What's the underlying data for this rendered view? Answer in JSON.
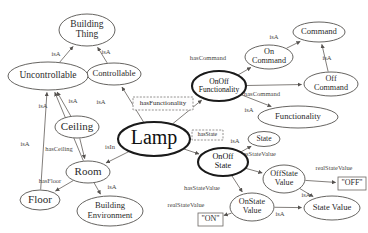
{
  "diagram": {
    "type": "ontology-graph",
    "colors": {
      "node_stroke": "#55524f",
      "emphasis_stroke": "#1a1a1a",
      "edge_stroke": "#6b6763",
      "text": "#2b2b2b",
      "background": "#ffffff"
    },
    "nodes": [
      {
        "id": "building-thing",
        "label": "Building Thing",
        "lines": [
          "Building",
          "Thing"
        ],
        "cx": 87,
        "cy": 30,
        "rx": 28,
        "ry": 16,
        "font": 9.5,
        "emph": false
      },
      {
        "id": "controllable",
        "label": "Controllable",
        "lines": [
          "Controllable"
        ],
        "cx": 114,
        "cy": 74,
        "rx": 27,
        "ry": 11,
        "font": 8.6,
        "emph": false
      },
      {
        "id": "uncontrollable",
        "label": "Uncontrollable",
        "lines": [
          "Uncontrollable"
        ],
        "cx": 48,
        "cy": 76,
        "rx": 40,
        "ry": 14,
        "font": 9.5,
        "emph": false
      },
      {
        "id": "ceiling",
        "label": "Ceiling",
        "lines": [
          "Ceiling"
        ],
        "cx": 77,
        "cy": 127,
        "rx": 22,
        "ry": 11,
        "font": 11,
        "emph": false
      },
      {
        "id": "room",
        "label": "Room",
        "lines": [
          "Room"
        ],
        "cx": 88,
        "cy": 172,
        "rx": 22,
        "ry": 11,
        "font": 11,
        "emph": false
      },
      {
        "id": "floor",
        "label": "Floor",
        "lines": [
          "Floor"
        ],
        "cx": 40,
        "cy": 200,
        "rx": 20,
        "ry": 10,
        "font": 11,
        "emph": false
      },
      {
        "id": "building-environment",
        "label": "Building Environment",
        "lines": [
          "Building",
          "Environment"
        ],
        "cx": 110,
        "cy": 211,
        "rx": 33,
        "ry": 15,
        "font": 8.6,
        "emph": false
      },
      {
        "id": "lamp",
        "label": "Lamp",
        "lines": [
          "Lamp"
        ],
        "cx": 154,
        "cy": 139,
        "rx": 36,
        "ry": 17,
        "font": 20,
        "emph": true
      },
      {
        "id": "onoff-functionality",
        "label": "OnOff Functionality",
        "lines": [
          "OnOff",
          "Functionality"
        ],
        "cx": 219,
        "cy": 86,
        "rx": 27,
        "ry": 15,
        "font": 7.6,
        "emph": true
      },
      {
        "id": "functionality",
        "label": "Functionality",
        "lines": [
          "Functionality"
        ],
        "cx": 298,
        "cy": 117,
        "rx": 40,
        "ry": 11,
        "font": 8.6,
        "emph": false
      },
      {
        "id": "on-command",
        "label": "On Command",
        "lines": [
          "On",
          "Command"
        ],
        "cx": 269,
        "cy": 57,
        "rx": 24,
        "ry": 12,
        "font": 8.2,
        "emph": false
      },
      {
        "id": "command",
        "label": "Command",
        "lines": [
          "Command"
        ],
        "cx": 319,
        "cy": 32,
        "rx": 26,
        "ry": 10,
        "font": 8.6,
        "emph": false
      },
      {
        "id": "off-command",
        "label": "Off Command",
        "lines": [
          "Off",
          "Command"
        ],
        "cx": 331,
        "cy": 84,
        "rx": 27,
        "ry": 12,
        "font": 8.2,
        "emph": false
      },
      {
        "id": "state",
        "label": "State",
        "lines": [
          "State"
        ],
        "cx": 264,
        "cy": 139,
        "rx": 16,
        "ry": 7.5,
        "font": 7.6,
        "emph": false
      },
      {
        "id": "onoff-state",
        "label": "OnOff State",
        "lines": [
          "OnOff",
          "State"
        ],
        "cx": 223,
        "cy": 162,
        "rx": 25,
        "ry": 14,
        "font": 8.2,
        "emph": true
      },
      {
        "id": "offstate-value",
        "label": "OffState Value",
        "lines": [
          "OffState",
          "Value"
        ],
        "cx": 284,
        "cy": 179,
        "rx": 21,
        "ry": 14,
        "font": 8.2,
        "emph": false
      },
      {
        "id": "onstate-value",
        "label": "OnState Value",
        "lines": [
          "OnState",
          "Value"
        ],
        "cx": 252,
        "cy": 207,
        "rx": 22,
        "ry": 14,
        "font": 8.2,
        "emph": false
      },
      {
        "id": "state-value",
        "label": "State Value",
        "lines": [
          "State Value"
        ],
        "cx": 332,
        "cy": 208,
        "rx": 28,
        "ry": 12,
        "font": 8.6,
        "emph": false
      }
    ],
    "property_boxes": [
      {
        "id": "has-functionality-box",
        "label": "hasFunctionality",
        "x": 133,
        "y": 97,
        "w": 60,
        "h": 13,
        "font": 7.0
      },
      {
        "id": "has-state-box",
        "label": "hasState",
        "x": 192,
        "y": 130,
        "w": 31,
        "h": 10,
        "font": 5.8
      }
    ],
    "literal_boxes": [
      {
        "id": "literal-off",
        "label": "\"OFF\"",
        "x": 338,
        "y": 177,
        "w": 28,
        "h": 13,
        "font": 8.0
      },
      {
        "id": "literal-on",
        "label": "\"ON\"",
        "x": 198,
        "y": 213,
        "w": 25,
        "h": 13,
        "font": 8.0
      }
    ],
    "edges": [
      {
        "id": "e-uncontrollable-buildingthing",
        "label": "isA",
        "from": "uncontrollable",
        "to": "building-thing",
        "lx": 56,
        "ly": 54,
        "font": 6.6
      },
      {
        "id": "e-controllable-buildingthing",
        "label": "isA",
        "from": "controllable",
        "to": "building-thing",
        "lx": 106,
        "ly": 52,
        "font": 6.6
      },
      {
        "id": "e-ceiling-uncontrollable",
        "label": "isA",
        "from": "ceiling",
        "to": "uncontrollable",
        "lx": 43,
        "ly": 106,
        "font": 6.6
      },
      {
        "id": "e-floor-uncontrollable",
        "label": "isA",
        "from": "floor",
        "to": "uncontrollable",
        "lx": 25,
        "ly": 144,
        "font": 6.6
      },
      {
        "id": "e-room-uncontrollable",
        "label": "isA",
        "from": "room",
        "to": "uncontrollable",
        "lx": 73,
        "ly": 101,
        "font": 6.6
      },
      {
        "id": "e-ceiling-room",
        "label": "hasCeiling",
        "from": "ceiling",
        "to": "room",
        "lx": 59,
        "ly": 150,
        "font": 6.4
      },
      {
        "id": "e-room-floor",
        "label": "hasFloor",
        "from": "room",
        "to": "floor",
        "lx": 50,
        "ly": 182,
        "font": 6.4
      },
      {
        "id": "e-room-buildingenv",
        "label": "isA",
        "from": "room",
        "to": "building-environment",
        "lx": 112,
        "ly": 187,
        "font": 6.6
      },
      {
        "id": "e-lamp-room",
        "label": "isIn",
        "from": "lamp",
        "to": "room",
        "lx": 110,
        "ly": 147,
        "font": 6.6
      },
      {
        "id": "e-lamp-controllable",
        "label": "isA",
        "from": "lamp",
        "to": "controllable",
        "lx": 101,
        "ly": 102,
        "font": 6.6
      },
      {
        "id": "e-lamp-onofffunctionality",
        "label": "hasFunctionality",
        "from": "lamp",
        "to": "onoff-functionality",
        "lx": 163,
        "ly": 103,
        "font": 7.0
      },
      {
        "id": "e-onofffunc-functionality",
        "label": "isA",
        "from": "onoff-functionality",
        "to": "functionality",
        "lx": 249,
        "ly": 110,
        "font": 6.6
      },
      {
        "id": "e-onofffunc-oncommand",
        "label": "hasCommand",
        "from": "onoff-functionality",
        "to": "on-command",
        "lx": 208,
        "ly": 58,
        "font": 6.6
      },
      {
        "id": "e-onofffunc-offcommand",
        "label": "hasCommand",
        "from": "onoff-functionality",
        "to": "off-command",
        "lx": 262,
        "ly": 94,
        "font": 6.6
      },
      {
        "id": "e-oncommand-command",
        "label": "isA",
        "from": "on-command",
        "to": "command",
        "lx": 274,
        "ly": 37,
        "font": 6.6
      },
      {
        "id": "e-offcommand-command",
        "label": "isA",
        "from": "off-command",
        "to": "command",
        "lx": 327,
        "ly": 58,
        "font": 6.6
      },
      {
        "id": "e-lamp-onoffstate",
        "label": "hasState",
        "from": "lamp",
        "to": "onoff-state",
        "lx": 207,
        "ly": 135,
        "font": 5.8
      },
      {
        "id": "e-onoffstate-state",
        "label": "isA",
        "from": "onoff-state",
        "to": "state",
        "lx": 235,
        "ly": 141,
        "font": 6.6
      },
      {
        "id": "e-onoffstate-offstatevalue",
        "label": "hasStateValue",
        "from": "onoff-state",
        "to": "offstate-value",
        "lx": 258,
        "ly": 155,
        "font": 6.4
      },
      {
        "id": "e-onoffstate-onstatevalue",
        "label": "hasStateValue",
        "from": "onoff-state",
        "to": "onstate-value",
        "lx": 202,
        "ly": 189,
        "font": 6.4
      },
      {
        "id": "e-offstatevalue-statevalue",
        "label": "isA",
        "from": "offstate-value",
        "to": "state-value",
        "lx": 306,
        "ly": 195,
        "font": 6.6
      },
      {
        "id": "e-onstatevalue-statevalue",
        "label": "isA",
        "from": "onstate-value",
        "to": "state-value",
        "lx": 280,
        "ly": 214,
        "font": 6.6
      },
      {
        "id": "e-offstatevalue-literal",
        "label": "realStateValue",
        "from": "offstate-value",
        "to": "literal-off",
        "lx": 334,
        "ly": 169,
        "font": 6.4
      },
      {
        "id": "e-onstatevalue-literal",
        "label": "realStateValue",
        "from": "onstate-value",
        "to": "literal-on",
        "lx": 186,
        "ly": 206,
        "font": 6.4
      }
    ]
  }
}
